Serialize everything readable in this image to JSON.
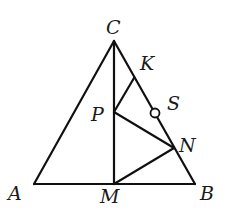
{
  "diagram": {
    "type": "geometry",
    "points": {
      "A": {
        "label": "A",
        "x": 34,
        "y": 184,
        "lx": 8,
        "ly": 200
      },
      "B": {
        "label": "B",
        "x": 195,
        "y": 184,
        "lx": 200,
        "ly": 200
      },
      "C": {
        "label": "C",
        "x": 114,
        "y": 41,
        "lx": 106,
        "ly": 34
      },
      "M": {
        "label": "M",
        "x": 114,
        "y": 184,
        "lx": 100,
        "ly": 203
      },
      "K": {
        "label": "K",
        "x": 134,
        "y": 78,
        "lx": 140,
        "ly": 70
      },
      "P": {
        "label": "P",
        "x": 114,
        "y": 112,
        "lx": 91,
        "ly": 121
      },
      "S": {
        "label": "S",
        "x": 155,
        "y": 113,
        "lx": 167,
        "ly": 110
      },
      "N": {
        "label": "N",
        "x": 174,
        "y": 148,
        "lx": 179,
        "ly": 152
      }
    },
    "segments": [
      [
        "A",
        "B"
      ],
      [
        "A",
        "C"
      ],
      [
        "C",
        "B"
      ],
      [
        "C",
        "M"
      ],
      [
        "P",
        "K"
      ],
      [
        "P",
        "N"
      ],
      [
        "M",
        "N"
      ]
    ],
    "marked_points": [
      {
        "point": "S",
        "style": "open-circle",
        "radius": 4.5
      }
    ],
    "colors": {
      "stroke": "#111111",
      "background": "#ffffff",
      "text": "#1a1a1a"
    }
  }
}
